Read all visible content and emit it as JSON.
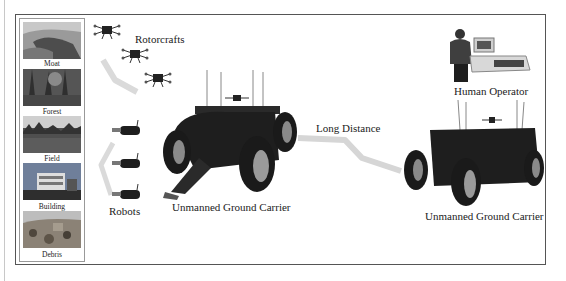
{
  "figure": {
    "scenes": [
      {
        "label": "Moat",
        "colors": [
          "#8d8d8d",
          "#5a5a5a",
          "#b5b5b5"
        ]
      },
      {
        "label": "Forest",
        "colors": [
          "#6b6b6b",
          "#3e3e3e",
          "#9a9a9a"
        ]
      },
      {
        "label": "Field",
        "colors": [
          "#c9c9c9",
          "#555555",
          "#4a4a4a"
        ]
      },
      {
        "label": "Building",
        "colors": [
          "#7a8aa6",
          "#d9d9d9",
          "#333333"
        ]
      },
      {
        "label": "Debris",
        "colors": [
          "#bdbdbd",
          "#7c7368",
          "#5d5448"
        ]
      }
    ],
    "labels": {
      "rotorcrafts": "Rotorcrafts",
      "robots": "Robots",
      "ugc_left": "Unmanned Ground Carrier",
      "ugc_right": "Unmanned Ground Carrier",
      "long_distance": "Long Distance",
      "human_operator": "Human Operator"
    },
    "colors": {
      "frame": "#555555",
      "arrow_band": "#d9d9d9",
      "vehicle": "#1e1e1e",
      "tire_hub": "#9a9a9a"
    }
  }
}
